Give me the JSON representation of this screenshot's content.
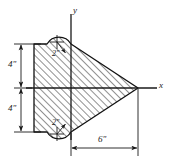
{
  "figure": {
    "axes": {
      "y_label": "y",
      "x_label": "x",
      "color": "#1a1a1a"
    },
    "dimensions": [
      {
        "id": "upper_height",
        "label": "4\"",
        "value": 4,
        "unit": "in",
        "orientation": "vertical"
      },
      {
        "id": "lower_height",
        "label": "4\"",
        "value": 4,
        "unit": "in",
        "orientation": "vertical"
      },
      {
        "id": "base_to_apex",
        "label": "6\"",
        "value": 6,
        "unit": "in",
        "orientation": "horizontal"
      }
    ],
    "radii": [
      {
        "id": "upper_notch_radius",
        "label": "2\"",
        "value": 2,
        "unit": "in"
      },
      {
        "id": "lower_notch_radius",
        "label": "2\"",
        "value": 2,
        "unit": "in"
      }
    ],
    "style": {
      "hatch_color": "#2b2b2b",
      "outline_color": "#111111",
      "background": "#ffffff"
    }
  }
}
